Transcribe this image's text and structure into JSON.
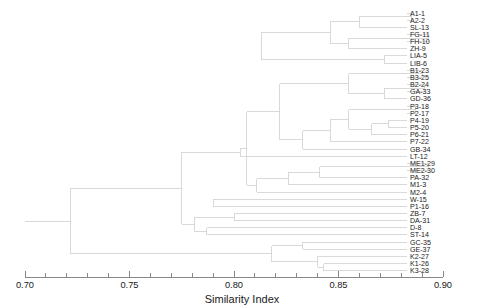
{
  "chart_data": {
    "type": "dendrogram",
    "title": "",
    "xlabel": "Similarity Index",
    "ylabel": "",
    "xlim": [
      0.7,
      0.9
    ],
    "grid": false,
    "legend": null,
    "orientation": "horizontal-right-leaves",
    "line_color": "#d0d0d0",
    "text_color": "#1a1a1a",
    "axis_ticks_major": [
      {
        "value": 0.7,
        "label": "0.70"
      },
      {
        "value": 0.75,
        "label": "0.75"
      },
      {
        "value": 0.8,
        "label": "0.80"
      },
      {
        "value": 0.85,
        "label": "0.85"
      },
      {
        "value": 0.9,
        "label": "0.90"
      }
    ],
    "axis_ticks_minor": [
      0.71,
      0.72,
      0.73,
      0.74,
      0.76,
      0.77,
      0.78,
      0.79,
      0.81,
      0.82,
      0.83,
      0.84,
      0.86,
      0.87,
      0.88,
      0.89
    ],
    "leaves": [
      {
        "label": "A1-1",
        "merge_similarity": 0.885
      },
      {
        "label": "A2-2",
        "merge_similarity": 0.885
      },
      {
        "label": "SL-13",
        "merge_similarity": 0.86
      },
      {
        "label": "FG-11",
        "merge_similarity": 0.893
      },
      {
        "label": "FH-10",
        "merge_similarity": 0.893
      },
      {
        "label": "ZH-9",
        "merge_similarity": 0.855
      },
      {
        "label": "LIA-5",
        "merge_similarity": 0.872
      },
      {
        "label": "LIB-6",
        "merge_similarity": 0.872
      },
      {
        "label": "B1-23",
        "merge_similarity": 0.89
      },
      {
        "label": "B3-25",
        "merge_similarity": 0.89
      },
      {
        "label": "B2-24",
        "merge_similarity": 0.891
      },
      {
        "label": "GA-33",
        "merge_similarity": 0.891
      },
      {
        "label": "GD-36",
        "merge_similarity": 0.872
      },
      {
        "label": "P3-18",
        "merge_similarity": 0.887
      },
      {
        "label": "P2-17",
        "merge_similarity": 0.887
      },
      {
        "label": "P4-19",
        "merge_similarity": 0.874
      },
      {
        "label": "P5-20",
        "merge_similarity": 0.874
      },
      {
        "label": "P6-21",
        "merge_similarity": 0.866
      },
      {
        "label": "P7-22",
        "merge_similarity": 0.855
      },
      {
        "label": "GB-34",
        "merge_similarity": 0.846
      },
      {
        "label": "LT-12",
        "merge_similarity": 0.833
      },
      {
        "label": "ME1-29",
        "merge_similarity": 0.893
      },
      {
        "label": "ME2-30",
        "merge_similarity": 0.893
      },
      {
        "label": "PA-32",
        "merge_similarity": 0.841
      },
      {
        "label": "M1-3",
        "merge_similarity": 0.826
      },
      {
        "label": "M2-4",
        "merge_similarity": 0.811
      },
      {
        "label": "W-15",
        "merge_similarity": 0.79
      },
      {
        "label": "P1-16",
        "merge_similarity": 0.79
      },
      {
        "label": "ZB-7",
        "merge_similarity": 0.8
      },
      {
        "label": "DA-31",
        "merge_similarity": 0.8
      },
      {
        "label": "D-8",
        "merge_similarity": 0.787
      },
      {
        "label": "ST-14",
        "merge_similarity": 0.787
      },
      {
        "label": "GC-35",
        "merge_similarity": 0.833
      },
      {
        "label": "GE-37",
        "merge_similarity": 0.833
      },
      {
        "label": "K2-27",
        "merge_similarity": 0.84
      },
      {
        "label": "K1-26",
        "merge_similarity": 0.843
      },
      {
        "label": "K3-28",
        "merge_similarity": 0.843
      }
    ],
    "nodes": [
      {
        "id": "n1",
        "similarity": 0.885,
        "children": [
          "A1-1",
          "A2-2"
        ]
      },
      {
        "id": "n2",
        "similarity": 0.86,
        "children": [
          "n1",
          "SL-13"
        ]
      },
      {
        "id": "n3",
        "similarity": 0.893,
        "children": [
          "FG-11",
          "FH-10"
        ]
      },
      {
        "id": "n4",
        "similarity": 0.855,
        "children": [
          "n3",
          "ZH-9"
        ]
      },
      {
        "id": "n5",
        "similarity": 0.846,
        "children": [
          "n2",
          "n4"
        ]
      },
      {
        "id": "n6",
        "similarity": 0.872,
        "children": [
          "LIA-5",
          "LIB-6"
        ]
      },
      {
        "id": "n7",
        "similarity": 0.813,
        "children": [
          "n5",
          "n6"
        ]
      },
      {
        "id": "n8",
        "similarity": 0.89,
        "children": [
          "B1-23",
          "B3-25"
        ]
      },
      {
        "id": "n9",
        "similarity": 0.891,
        "children": [
          "B2-24",
          "GA-33"
        ]
      },
      {
        "id": "n10",
        "similarity": 0.872,
        "children": [
          "n9",
          "GD-36"
        ]
      },
      {
        "id": "n11",
        "similarity": 0.855,
        "children": [
          "n8",
          "n10"
        ]
      },
      {
        "id": "n12",
        "similarity": 0.887,
        "children": [
          "P3-18",
          "P2-17"
        ]
      },
      {
        "id": "n13",
        "similarity": 0.874,
        "children": [
          "P4-19",
          "P5-20"
        ]
      },
      {
        "id": "n14",
        "similarity": 0.866,
        "children": [
          "n13",
          "P6-21"
        ]
      },
      {
        "id": "n15",
        "similarity": 0.855,
        "children": [
          "n12",
          "n14"
        ]
      },
      {
        "id": "n16",
        "similarity": 0.846,
        "children": [
          "n15",
          "P7-22"
        ]
      },
      {
        "id": "n17",
        "similarity": 0.833,
        "children": [
          "n16",
          "GB-34"
        ]
      },
      {
        "id": "n18",
        "similarity": 0.822,
        "children": [
          "n11",
          "n17"
        ]
      },
      {
        "id": "n19",
        "similarity": 0.893,
        "children": [
          "ME1-29",
          "ME2-30"
        ]
      },
      {
        "id": "n20",
        "similarity": 0.841,
        "children": [
          "n19",
          "PA-32"
        ]
      },
      {
        "id": "n21",
        "similarity": 0.826,
        "children": [
          "n20",
          "M1-3"
        ]
      },
      {
        "id": "n22",
        "similarity": 0.811,
        "children": [
          "n21",
          "M2-4"
        ]
      },
      {
        "id": "n23",
        "similarity": 0.806,
        "children": [
          "n18",
          "n22"
        ]
      },
      {
        "id": "n24",
        "similarity": 0.803,
        "children": [
          "n23",
          "LT-12"
        ]
      },
      {
        "id": "n25",
        "similarity": 0.79,
        "children": [
          "W-15",
          "P1-16"
        ]
      },
      {
        "id": "n26",
        "similarity": 0.8,
        "children": [
          "ZB-7",
          "DA-31"
        ]
      },
      {
        "id": "n27",
        "similarity": 0.787,
        "children": [
          "D-8",
          "ST-14"
        ]
      },
      {
        "id": "n28",
        "similarity": 0.833,
        "children": [
          "GC-35",
          "GE-37"
        ]
      },
      {
        "id": "n29",
        "similarity": 0.843,
        "children": [
          "K1-26",
          "K3-28"
        ]
      },
      {
        "id": "n30",
        "similarity": 0.84,
        "children": [
          "K2-27",
          "n29"
        ]
      },
      {
        "id": "n31",
        "similarity": 0.818,
        "children": [
          "n28",
          "n30"
        ]
      },
      {
        "id": "n32",
        "similarity": 0.781,
        "children": [
          "n26",
          "n27"
        ]
      },
      {
        "id": "n33",
        "similarity": 0.775,
        "children": [
          "n24",
          "n32"
        ]
      },
      {
        "id": "n34",
        "similarity": 0.722,
        "children": [
          "n31",
          "n31b"
        ]
      },
      {
        "id": "n35",
        "similarity": 0.7,
        "children": [
          "root"
        ]
      }
    ],
    "root_similarity": 0.7
  }
}
